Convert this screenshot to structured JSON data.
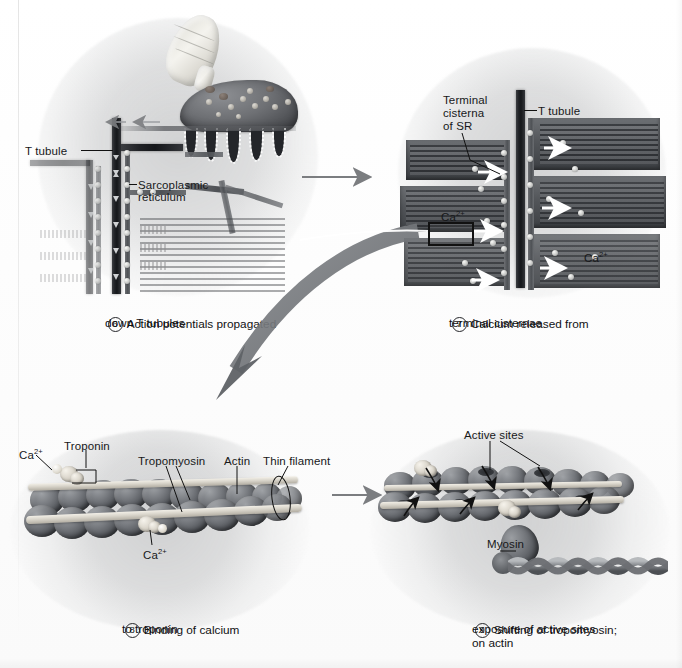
{
  "figure": {
    "panels": [
      {
        "id": "panel-6",
        "number": "6",
        "caption_line1": "Action potentials propagated",
        "caption_line2": "down T tubules",
        "labels": [
          {
            "name": "t-tubule",
            "text": "T tubule"
          },
          {
            "name": "sarcoplasmic-reticulum-line1",
            "text": "Sarcoplasmic"
          },
          {
            "name": "sarcoplasmic-reticulum-line2",
            "text": "reticulum"
          }
        ]
      },
      {
        "id": "panel-7",
        "number": "7",
        "caption_line1": "Calcium released from",
        "caption_line2": "terminal cisternae",
        "labels": [
          {
            "name": "terminal-cisterna-line1",
            "text": "Terminal"
          },
          {
            "name": "terminal-cisterna-line2",
            "text": "cisterna"
          },
          {
            "name": "terminal-cisterna-line3",
            "text": "of SR"
          },
          {
            "name": "t-tubule",
            "text": "T tubule"
          },
          {
            "name": "calcium-left",
            "text": "Ca",
            "sup": "2+"
          },
          {
            "name": "calcium-right",
            "text": "Ca",
            "sup": "2+"
          }
        ]
      },
      {
        "id": "panel-8",
        "number": "8",
        "caption_line1": "Binding of calcium",
        "caption_line2": "to troponin",
        "labels": [
          {
            "name": "calcium-top",
            "text": "Ca",
            "sup": "2+"
          },
          {
            "name": "troponin",
            "text": "Troponin"
          },
          {
            "name": "tropomyosin",
            "text": "Tropomyosin"
          },
          {
            "name": "actin",
            "text": "Actin"
          },
          {
            "name": "thin-filament",
            "text": "Thin filament"
          },
          {
            "name": "calcium-bottom",
            "text": "Ca",
            "sup": "2+"
          }
        ]
      },
      {
        "id": "panel-9",
        "number": "9",
        "caption_line1": "Shifting of tropomyosin;",
        "caption_line2": "exposure of active sites",
        "caption_line3": "on actin",
        "labels": [
          {
            "name": "active-sites",
            "text": "Active sites"
          },
          {
            "name": "myosin",
            "text": "Myosin"
          }
        ]
      }
    ],
    "flow_arrows": [
      {
        "name": "arrow-6-to-7",
        "direction": "right"
      },
      {
        "name": "arrow-7-to-8",
        "direction": "down-left-curved"
      },
      {
        "name": "arrow-8-to-9",
        "direction": "right"
      }
    ],
    "colors": {
      "background": "#fdfdfd",
      "ink": "#17181a",
      "arrow": "#7b7d80",
      "big_arrow": "#6e7074",
      "tubule_dark": "#15171a",
      "sr_grey": "#5b5e62",
      "actin_grey": "#76797e",
      "tropomyosin_cream": "#e6e2d8"
    }
  }
}
